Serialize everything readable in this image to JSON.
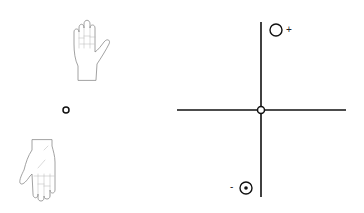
{
  "diagram": {
    "left_panel": {
      "upper_figure": "hand-fingers-up",
      "lower_figure": "hand-fingers-down",
      "center_marker": "small-circle"
    },
    "right_panel": {
      "axes": "crosshair",
      "origin_marker": "circle",
      "positive_marker": {
        "icon": "circle-open",
        "label": "+"
      },
      "negative_marker": {
        "icon": "circle-dot",
        "label": "-"
      }
    },
    "colors": {
      "stroke": "#111111",
      "hand_outline": "#8a8a8a",
      "background": "#ffffff"
    }
  }
}
